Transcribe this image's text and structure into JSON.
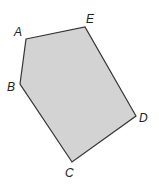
{
  "diagram": {
    "type": "pentagon",
    "fill": "#d3d3d3",
    "stroke": "#333333",
    "vertices": [
      {
        "name": "A",
        "x": 26,
        "y": 39,
        "lx": 14,
        "ly": 36
      },
      {
        "name": "E",
        "x": 85,
        "y": 27,
        "lx": 86,
        "ly": 23
      },
      {
        "name": "D",
        "x": 136,
        "y": 116,
        "lx": 139,
        "ly": 122
      },
      {
        "name": "C",
        "x": 72,
        "y": 162,
        "lx": 65,
        "ly": 177
      },
      {
        "name": "B",
        "x": 20,
        "y": 84,
        "lx": 7,
        "ly": 91
      }
    ],
    "labels": {
      "A": "A",
      "B": "B",
      "C": "C",
      "D": "D",
      "E": "E"
    }
  }
}
